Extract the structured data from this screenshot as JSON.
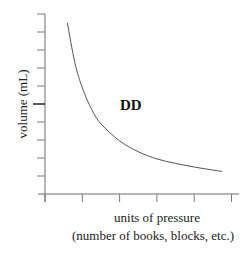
{
  "chart_data": {
    "type": "line",
    "title": "",
    "xlabel": "units of pressure",
    "xlabel_sub": "(number of books, blocks, etc.)",
    "ylabel": "volume (mL)",
    "annotation": "DD",
    "x_ticks": 6,
    "y_ticks": 10,
    "y_major_tick_index": 5,
    "xlim": [
      0,
      5.3
    ],
    "ylim": [
      0,
      10
    ],
    "grid": false,
    "series": [
      {
        "name": "volume vs pressure",
        "x": [
          0.6,
          0.8,
          1.0,
          1.25,
          1.5,
          2.0,
          2.5,
          3.0,
          3.5,
          4.0,
          4.5,
          4.75
        ],
        "y": [
          9.5,
          7.3,
          5.9,
          4.7,
          3.9,
          2.95,
          2.35,
          1.95,
          1.7,
          1.5,
          1.33,
          1.25
        ]
      }
    ]
  }
}
